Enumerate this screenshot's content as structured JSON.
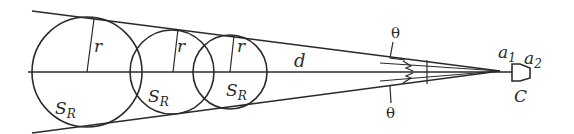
{
  "diagram": {
    "labels": {
      "radius": "r",
      "distance": "d",
      "sphere_main": "S",
      "sphere_sub": "R",
      "angle_top": "θ",
      "angle_bottom": "θ",
      "a1_main": "a",
      "a1_sub": "1",
      "a2_main": "a",
      "a2_sub": "2",
      "camera": "C"
    },
    "circles_count": 3
  }
}
